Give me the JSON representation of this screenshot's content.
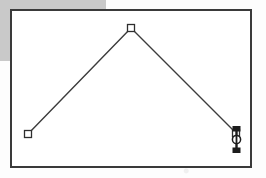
{
  "screen": {
    "width": 266,
    "height": 178,
    "background_color": "#fdfdfd"
  },
  "background_band": {
    "label": "gray-overlay-band",
    "color": "#c9c9c9",
    "residual_text": "",
    "x": 0,
    "y": 0,
    "width": 106,
    "height": 61
  },
  "canvas": {
    "label": "drawing-canvas",
    "fill_color": "#ffffff",
    "border_color": "#3a3a3a",
    "border_width": 2,
    "x": 10,
    "y": 9,
    "width": 242,
    "height": 159
  },
  "drawing": {
    "shape_name": "polyline-chevron",
    "stroke_color": "#3c3c3c",
    "stroke_width": 1.4,
    "fill": "none",
    "points": [
      {
        "name": "vertex-left",
        "x": 28,
        "y": 134
      },
      {
        "name": "vertex-apex",
        "x": 131,
        "y": 28
      },
      {
        "name": "vertex-right",
        "x": 236,
        "y": 133
      }
    ],
    "handles": [
      {
        "name": "handle-vertex-left",
        "x": 28,
        "y": 134,
        "size": 7,
        "fill": "#ffffff",
        "stroke": "#2e2e2e",
        "selected": false
      },
      {
        "name": "handle-vertex-apex",
        "x": 131,
        "y": 28,
        "size": 7,
        "fill": "#ffffff",
        "stroke": "#2e2e2e",
        "selected": false
      },
      {
        "name": "handle-vertex-right",
        "x": 236,
        "y": 133,
        "size": 7,
        "fill": "#ffffff",
        "stroke": "#2e2e2e",
        "selected": true
      }
    ]
  },
  "cursor": {
    "name": "resize-vertical-cursor",
    "color": "#1c1c1c",
    "x": 230,
    "y": 126,
    "width": 13,
    "height": 27
  }
}
